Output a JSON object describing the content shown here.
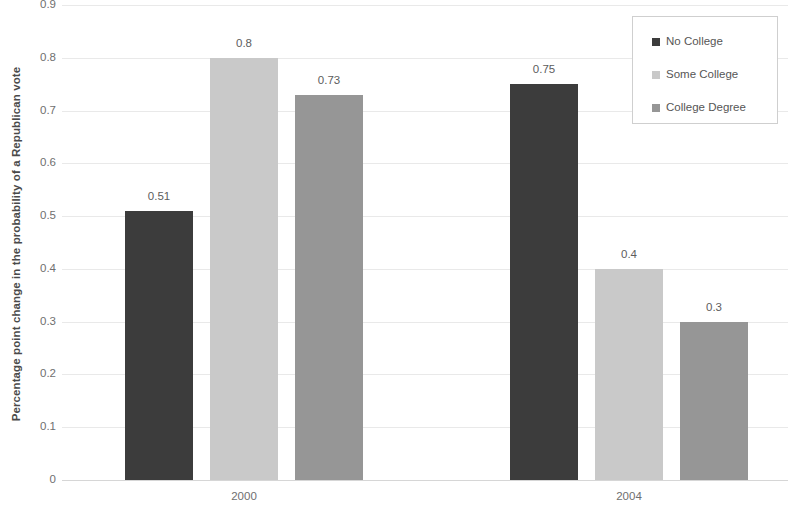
{
  "chart_data": {
    "type": "bar",
    "title": "",
    "xlabel": "",
    "ylabel": "Percentage point change in the probability of a Republican vote",
    "categories": [
      "2000",
      "2004"
    ],
    "series": [
      {
        "name": "No College",
        "color": "#3c3c3c",
        "values": [
          0.51,
          0.75
        ]
      },
      {
        "name": "Some College",
        "color": "#c9c9c9",
        "values": [
          0.8,
          0.4
        ]
      },
      {
        "name": "College Degree",
        "color": "#969696",
        "values": [
          0.73,
          0.3
        ]
      }
    ],
    "data_labels": [
      [
        "0.51",
        "0.8",
        "0.73"
      ],
      [
        "0.75",
        "0.4",
        "0.3"
      ]
    ],
    "ylim": [
      0,
      0.9
    ],
    "y_ticks": [
      "0.9",
      "0.8",
      "0.7",
      "0.6",
      "0.5",
      "0.4",
      "0.3",
      "0.2",
      "0.1",
      "0"
    ],
    "y_tick_values": [
      0.9,
      0.8,
      0.7,
      0.6,
      0.5,
      0.4,
      0.3,
      0.2,
      0.1,
      0
    ],
    "grid": true,
    "legend_position": "top-right",
    "legend_entries": [
      "No College",
      "Some College",
      "College Degree"
    ]
  },
  "axis": {
    "y_title": "Percentage point change in the probability of a Republican vote"
  }
}
